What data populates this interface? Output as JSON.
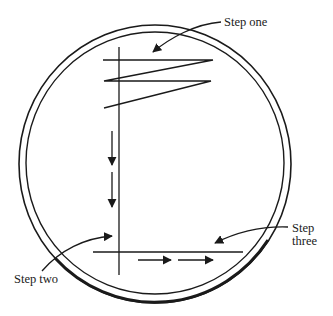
{
  "diagram": {
    "labels": {
      "step_one": "Step one",
      "step_two": "Step two",
      "step_three_line1": "Step",
      "step_three_line2": "three"
    },
    "colors": {
      "stroke": "#1a1a1a",
      "background": "#ffffff"
    }
  }
}
